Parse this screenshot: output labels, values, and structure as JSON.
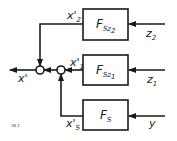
{
  "diagram": {
    "blocks": [
      {
        "id": "top",
        "label": "F",
        "sub": "Sz",
        "subsub": "2"
      },
      {
        "id": "middle",
        "label": "F",
        "sub": "Sz",
        "subsub": "1"
      },
      {
        "id": "bottom",
        "label": "F",
        "sub": "S",
        "subsub": ""
      }
    ],
    "inputs": [
      {
        "id": "z2",
        "label": "z",
        "sub": "2"
      },
      {
        "id": "z1",
        "label": "z",
        "sub": "1"
      },
      {
        "id": "y",
        "label": "y",
        "sub": ""
      }
    ],
    "intermediate": [
      {
        "id": "x2",
        "label": "x'",
        "sub": "2"
      },
      {
        "id": "x1",
        "label": "x'",
        "sub": "1"
      },
      {
        "id": "xS",
        "label": "x'",
        "sub": "S"
      }
    ],
    "output": {
      "label": "x'"
    },
    "figure_number": "38.1",
    "colors": {
      "line": "#1a1a1a",
      "background": "#ffffff"
    }
  }
}
